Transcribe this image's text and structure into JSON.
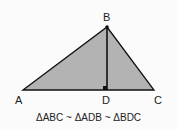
{
  "diagram": {
    "colors": {
      "fill": "#b3b3b3",
      "stroke": "#111111",
      "background": "#fbfbfb"
    },
    "points": {
      "A": {
        "label": "A",
        "x": 23,
        "y": 90
      },
      "B": {
        "label": "B",
        "x": 107,
        "y": 27
      },
      "C": {
        "label": "C",
        "x": 154,
        "y": 90
      },
      "D": {
        "label": "D",
        "x": 107,
        "y": 90
      }
    },
    "caption": "ΔABC ~ ΔADB ~ ΔBDC"
  }
}
